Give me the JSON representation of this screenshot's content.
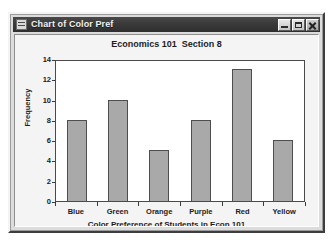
{
  "window": {
    "title": "Chart of Color Pref",
    "icon": "window-menu-icon",
    "controls": [
      {
        "name": "minimize-button",
        "glyph": "minimize"
      },
      {
        "name": "maximize-button",
        "glyph": "maximize"
      },
      {
        "name": "close-button",
        "glyph": "close"
      }
    ],
    "titlebar_color": "#3a3a3a",
    "titlebar_text_color": "#f2f2f2",
    "client_background": "#f4f4f4"
  },
  "chart_data": {
    "type": "bar",
    "title": "Economics 101  Section 8",
    "xlabel": "Color Preference of Students in Econ 101",
    "ylabel": "Frequency",
    "categories": [
      "Blue",
      "Green",
      "Orange",
      "Purple",
      "Red",
      "Yellow"
    ],
    "values": [
      8,
      10,
      5,
      8,
      13,
      6
    ],
    "ylim": [
      0,
      14
    ],
    "ytick_step": 2,
    "yticks": [
      0,
      2,
      4,
      6,
      8,
      10,
      12,
      14
    ],
    "ytick_labels": [
      "0",
      "2",
      "4",
      "6",
      "8",
      "10",
      "12",
      "14"
    ],
    "grid": false,
    "legend": "none",
    "bar_color": "#a9a9a9",
    "bar_edge_color": "#4e4e4e",
    "plot_background": "#ffffff",
    "axis_color": "#4a4a4a",
    "series": [
      {
        "name": "Frequency",
        "values": [
          8,
          10,
          5,
          8,
          13,
          6
        ]
      }
    ]
  }
}
